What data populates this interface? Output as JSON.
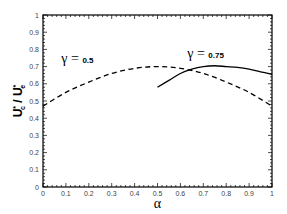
{
  "chart_data": {
    "type": "line",
    "title": "",
    "xlabel": "α",
    "ylabel": "U*c / U*e",
    "ylabel_parts": {
      "num": "U",
      "num_sup": "*",
      "num_sub": "c",
      "sep": " / ",
      "den": "U",
      "den_sup": "*",
      "den_sub": "e"
    },
    "xlim": [
      0,
      1
    ],
    "ylim": [
      0,
      1
    ],
    "x_ticks": [
      "0",
      "0.1",
      "0.2",
      "0.3",
      "0.4",
      "0.5",
      "0.6",
      "0.7",
      "0.8",
      "0.9",
      "1"
    ],
    "y_ticks": [
      "0",
      "0.1",
      "0.2",
      "0.3",
      "0.4",
      "0.5",
      "0.6",
      "0.7",
      "0.8",
      "0.9",
      "1"
    ],
    "grid": false,
    "series": [
      {
        "name": "γ = 0.5",
        "style": "dashed",
        "x": [
          0,
          0.1,
          0.2,
          0.3,
          0.4,
          0.5,
          0.6,
          0.7,
          0.8,
          0.9,
          1.0
        ],
        "y": [
          0.47,
          0.55,
          0.61,
          0.66,
          0.69,
          0.7,
          0.69,
          0.66,
          0.61,
          0.55,
          0.47
        ]
      },
      {
        "name": "γ = 0.75",
        "style": "solid",
        "x": [
          0.5,
          0.55,
          0.6,
          0.65,
          0.7,
          0.75,
          0.8,
          0.85,
          0.9,
          0.95,
          1.0
        ],
        "y": [
          0.58,
          0.62,
          0.66,
          0.685,
          0.7,
          0.705,
          0.7,
          0.695,
          0.685,
          0.67,
          0.655
        ]
      }
    ],
    "annotations": [
      {
        "symbol": "γ",
        "eq": " = ",
        "value": "0.5",
        "x": 0.08,
        "y": 0.72
      },
      {
        "symbol": "γ",
        "eq": " = ",
        "value": "0.75",
        "x": 0.63,
        "y": 0.75
      }
    ]
  }
}
